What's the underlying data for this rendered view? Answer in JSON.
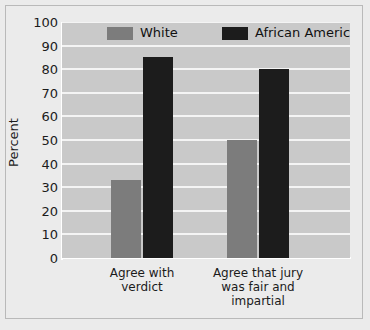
{
  "chart_data": {
    "type": "bar",
    "title": "",
    "subtitle": "",
    "xlabel": "",
    "ylabel": "Percent",
    "ylim": [
      0,
      100
    ],
    "yticks": [
      0,
      10,
      20,
      30,
      40,
      50,
      60,
      70,
      80,
      90,
      100
    ],
    "ytick_labels": [
      "0",
      "10",
      "20",
      "30",
      "40",
      "50",
      "60",
      "70",
      "80",
      "90",
      "100"
    ],
    "categories": [
      "Agree with\nverdict",
      "Agree that jury\nwas fair and\nimpartial"
    ],
    "series": [
      {
        "name": "White",
        "color": "#7c7c7c",
        "values": [
          33,
          50
        ]
      },
      {
        "name": "African American",
        "color": "#1c1c1c",
        "values": [
          85,
          80
        ]
      }
    ],
    "grid": "horizontal",
    "grid_color": "#f4f4f4",
    "legend_position": "top-inside",
    "plot_background": "#c9c9c9",
    "figure_background": "#ebebeb"
  }
}
